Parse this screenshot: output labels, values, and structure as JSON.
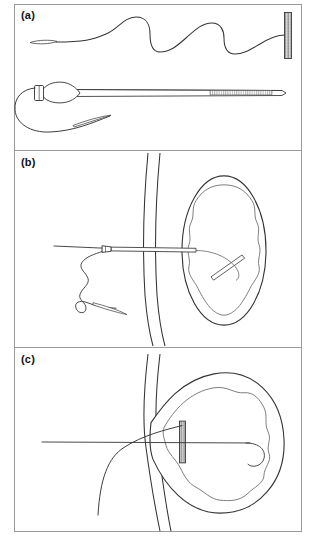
{
  "figure": {
    "panel_count": 3,
    "background_color": "#ffffff",
    "border_color": "#9a9a9a",
    "ink_color": "#2b2b2b",
    "light_ink_color": "#6f6f6f"
  },
  "panels": [
    {
      "id": "a",
      "label": "(a)",
      "caption_text": "(a)",
      "elements": [
        {
          "name": "guidewire-serpentine",
          "type": "wavy-wire",
          "description": "long sinusoidal guidewire with flattened tapered tip at left"
        },
        {
          "name": "guidewire-flat-tip",
          "type": "tapered-tip",
          "description": "flat lens-shaped soft tip"
        },
        {
          "name": "hatched-marker-bar",
          "type": "cross-hatched-bar",
          "description": "vertical cross-hatched radiopaque marker bar at right end"
        },
        {
          "name": "dilator-catheter",
          "type": "catheter-shaft",
          "description": "straight catheter shaft with olive-shaped dilator tip and hub"
        },
        {
          "name": "dilator-olive-tip",
          "type": "olive-bulb",
          "description": "tapered olive bulb near hub"
        },
        {
          "name": "catheter-hub",
          "type": "hub-collar",
          "description": "short collar / hub at proximal end"
        },
        {
          "name": "catheter-hatched-segment",
          "type": "hatched-segment",
          "description": "striped radiopaque segment along distal shaft"
        },
        {
          "name": "looped-guidewire",
          "type": "wire-loop",
          "description": "guidewire looping below the catheter back to a flat tip"
        }
      ]
    },
    {
      "id": "b",
      "label": "(b)",
      "caption_text": "(b)",
      "elements": [
        {
          "name": "gi-wall",
          "type": "double-line-wall",
          "description": "vertical double-line gastrointestinal / body wall"
        },
        {
          "name": "target-organ-outline",
          "type": "oval-outline",
          "description": "oval organ outer capsule"
        },
        {
          "name": "target-organ-inner-lining",
          "type": "wavy-oval",
          "description": "wavy inner mucosal lining of the organ"
        },
        {
          "name": "needle-catheter",
          "type": "needle-assembly",
          "description": "needle/catheter advanced through the wall into the organ lumen"
        },
        {
          "name": "needle-hub",
          "type": "hub-collar",
          "description": "small hub collar on the needle shaft"
        },
        {
          "name": "guidewire-proximal",
          "type": "straight-wire",
          "description": "straight guidewire extending to the left out of the field"
        },
        {
          "name": "coiled-guidewire-external",
          "type": "wavy-wire",
          "description": "redundant wavy guidewire coiled outside the wall"
        },
        {
          "name": "guidewire-flat-tip",
          "type": "tapered-tip",
          "description": "flattened guidewire tip below the coil"
        },
        {
          "name": "intraluminal-wire-segment",
          "type": "straight-segment",
          "description": "short angled wire segment inside the organ lumen"
        },
        {
          "name": "intraluminal-wire-curl",
          "type": "curved-hook",
          "description": "curved wire hook within the organ lumen"
        }
      ]
    },
    {
      "id": "c",
      "label": "(c)",
      "caption_text": "(c)",
      "elements": [
        {
          "name": "gi-wall",
          "type": "double-line-wall",
          "description": "vertical double-line gastrointestinal / body wall"
        },
        {
          "name": "target-organ-outline",
          "type": "tented-oval-outline",
          "description": "organ capsule tented and apposed against the wall"
        },
        {
          "name": "target-organ-inner-lining",
          "type": "wavy-oval",
          "description": "wavy inner lining following the tented capsule"
        },
        {
          "name": "deployed-stent-marker",
          "type": "cross-hatched-bar",
          "description": "vertical cross-hatched stent / anchor deployed at the fistula tract"
        },
        {
          "name": "guidewire-through-tract",
          "type": "straight-wire",
          "description": "guidewire running horizontally through the tract into the lumen"
        },
        {
          "name": "pigtail-curl",
          "type": "curved-hook",
          "description": "distal pigtail curl of the catheter inside the organ lumen"
        },
        {
          "name": "traction-wire-loop",
          "type": "long-curve",
          "description": "large curving wire sweeping down and left outside the wall"
        }
      ]
    }
  ]
}
